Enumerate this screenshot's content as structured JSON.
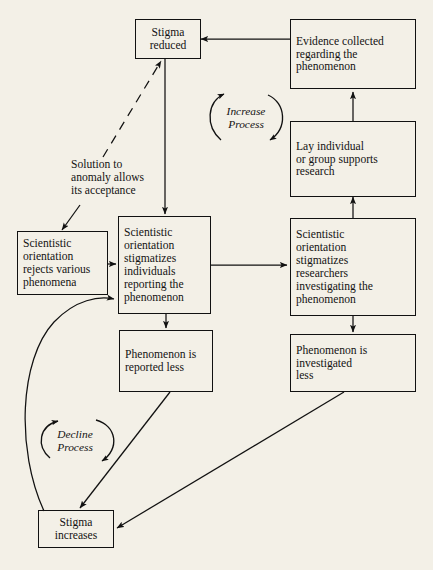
{
  "diagram": {
    "background_color": "#f3f0e7",
    "line_color": "#111111",
    "nodes": [
      {
        "id": "stigma-reduced",
        "label": "Stigma\nreduced"
      },
      {
        "id": "evidence-collected",
        "label": "Evidence collected\nregarding the\nphenomenon"
      },
      {
        "id": "lay-individual",
        "label": "Lay individual\nor group supports\nresearch"
      },
      {
        "id": "orientation-rejects",
        "label": "Scientistic\norientation\nrejects various\nphenomena"
      },
      {
        "id": "stigmatizes-individuals",
        "label": "Scientistic\norientation\nstigmatizes\nindividuals\nreporting the\nphenomenon"
      },
      {
        "id": "stigmatizes-researchers",
        "label": "Scientistic\norientation\nstigmatizes\nresearchers\ninvestigating the\nphenomenon"
      },
      {
        "id": "reported-less",
        "label": "Phenomenon is\nreported less"
      },
      {
        "id": "investigated-less",
        "label": "Phenomenon is\ninvestigated\nless"
      },
      {
        "id": "stigma-increases",
        "label": "Stigma\nincreases"
      }
    ],
    "loops": [
      {
        "id": "increase-process",
        "label": "Increase\nProcess"
      },
      {
        "id": "decline-process",
        "label": "Decline\nProcess"
      }
    ],
    "annotations": [
      {
        "id": "solution-to-anomaly",
        "label": "Solution to\nanomaly allows\nits acceptance"
      }
    ]
  }
}
